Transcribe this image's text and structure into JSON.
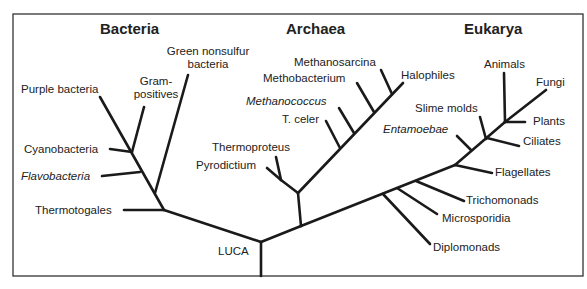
{
  "domains": {
    "bacteria": "Bacteria",
    "archaea": "Archaea",
    "eukarya": "Eukarya"
  },
  "root": "LUCA",
  "bacteria": {
    "green_1": "Green nonsulfur",
    "green_2": "bacteria",
    "gram_1": "Gram-",
    "gram_2": "positives",
    "purple": "Purple bacteria",
    "cyano": "Cyanobacteria",
    "flavo": "Flavobacteria",
    "thermotogales": "Thermotogales"
  },
  "archaea": {
    "methanosarcina": "Methanosarcina",
    "methobacterium": "Methobacterium",
    "halophiles": "Halophiles",
    "methanococcus": "Methanococcus",
    "tceler": "T. celer",
    "thermoproteus": "Thermoproteus",
    "pyrodictium": "Pyrodictium"
  },
  "eukarya": {
    "animals": "Animals",
    "fungi": "Fungi",
    "slime": "Slime molds",
    "plants": "Plants",
    "entamoebae": "Entamoebae",
    "ciliates": "Ciliates",
    "flagellates": "Flagellates",
    "trichomonads": "Trichomonads",
    "microsporidia": "Microsporidia",
    "diplomonads": "Diplomonads"
  }
}
